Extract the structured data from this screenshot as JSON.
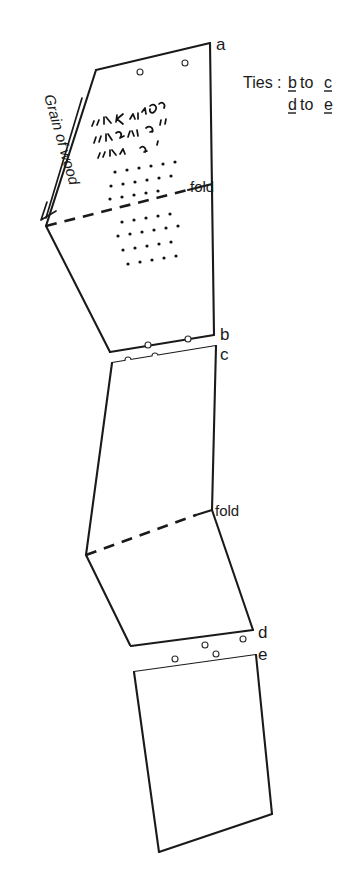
{
  "figure": {
    "background_color": "#ffffff",
    "ink_color": "#1a1a1a"
  },
  "annotations": {
    "grain_label": "Grain of wood",
    "ties_prefix": "Ties :",
    "ties_line1_from": "b",
    "ties_line1_mid": "to",
    "ties_line1_to": "c",
    "ties_line2_from": "d",
    "ties_line2_mid": "to",
    "ties_line2_to": "e",
    "fold_label_upper": "fold",
    "fold_label_lower": "fold"
  },
  "corner_labels": {
    "a": "a",
    "b": "b",
    "c": "c",
    "d": "d",
    "e": "e"
  },
  "panels": [
    {
      "name": "panel-top",
      "corner_start": "a",
      "corner_end": "b",
      "has_fold": true,
      "has_script": true,
      "has_dotted_text": true
    },
    {
      "name": "panel-middle",
      "corner_start": "c",
      "corner_end": "d",
      "has_fold": true,
      "has_script": false,
      "has_dotted_text": false
    },
    {
      "name": "panel-bottom",
      "corner_start": "e",
      "corner_end": "",
      "has_fold": false,
      "has_script": false,
      "has_dotted_text": false
    }
  ],
  "tie_holes": {
    "top_edge_count": 2,
    "bc_junction_count": 4,
    "de_junction_count": 4,
    "total": 10
  },
  "dotted_text_rows": {
    "above_fold": 3,
    "below_fold": 4
  },
  "script_lines": 3
}
